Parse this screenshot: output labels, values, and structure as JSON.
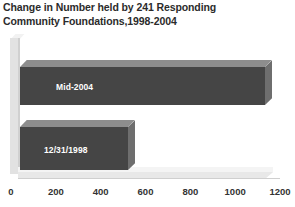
{
  "chart_data": {
    "type": "bar",
    "orientation": "horizontal",
    "title": "Change in Number held by 241 Responding Community Foundations,1998-2004",
    "title_lines": [
      "Change in Number held by 241 Responding",
      "Community Foundations,1998-2004"
    ],
    "xlabel": "",
    "ylabel": "",
    "categories": [
      "Mid-2004",
      "12/31/1998"
    ],
    "values": [
      1095,
      480
    ],
    "xlim": [
      0,
      1200
    ],
    "xticks": [
      0,
      200,
      400,
      600,
      800,
      1000,
      1200
    ],
    "xtick_labels": [
      "0",
      "200",
      "400",
      "600",
      "800",
      "1000",
      "1200"
    ],
    "grid": false,
    "legend": "none",
    "bars": [
      {
        "label": "Mid-2004",
        "value": 1095
      },
      {
        "label": "12/31/1998",
        "value": 480
      }
    ],
    "colors": {
      "bar_front": "#454545",
      "bar_top": "#8d8d8d",
      "bar_side": "#6e6e6e",
      "bar_label_text": "#ffffff",
      "title_text": "#2b2b2b",
      "axis_text": "#333333",
      "plot_background": "#ffffff",
      "floor": "#e8e8e8",
      "wall": "#e2e2e2"
    }
  }
}
